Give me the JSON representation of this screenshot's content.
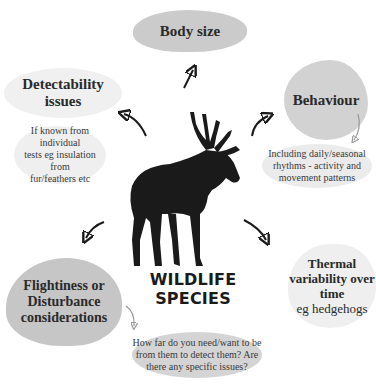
{
  "center": {
    "label": "WILDLIFE SPECIES",
    "icon": "moose-silhouette-icon"
  },
  "nodes": {
    "body_size": {
      "title": "Body size"
    },
    "detectability": {
      "title_line1": "Detectability",
      "title_line2": "issues",
      "note_line1": "If known from individual",
      "note_line2": "tests eg insulation from",
      "note_line3": "fur/feathers etc"
    },
    "behaviour": {
      "title": "Behaviour",
      "note_line1": "Including daily/seasonal",
      "note_line2": "rhythms - activity and",
      "note_line3": "movement patterns"
    },
    "thermal": {
      "title_line1": "Thermal",
      "title_line2": "variability over",
      "title_line3": "time",
      "note": "eg hedgehogs"
    },
    "flightiness": {
      "title_line1": "Flightiness or",
      "title_line2": "Disturbance",
      "title_line3": "considerations",
      "note_line1": "How far do you need/want to be",
      "note_line2": "from them to detect them? Are",
      "note_line3": "there any specific issues?"
    }
  },
  "colors": {
    "blob_dark": "#c9c9c9",
    "blob_light": "#ececec",
    "arrow": "#1a1a1a",
    "arrow_light": "#9a9a9a"
  }
}
